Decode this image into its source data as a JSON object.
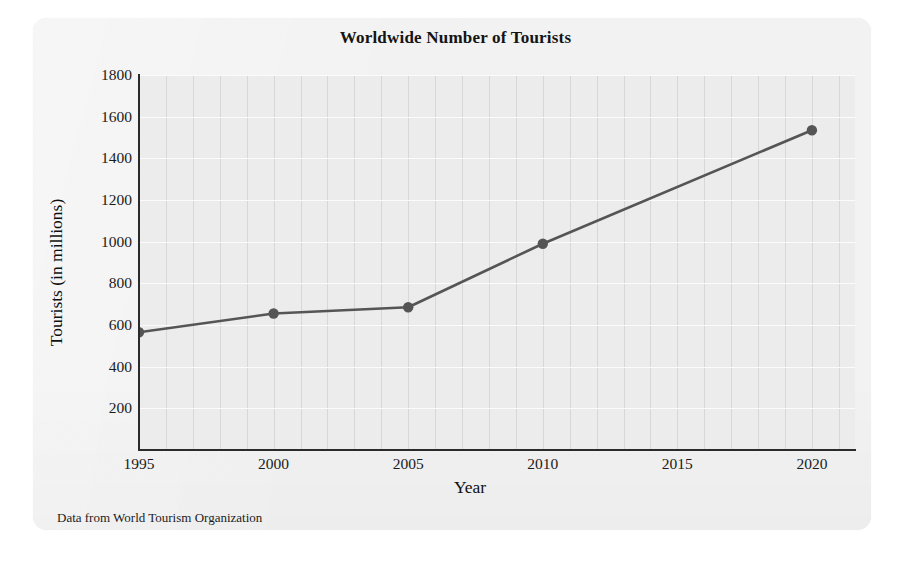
{
  "card": {
    "background_color": "#f2f2f2"
  },
  "chart_data": {
    "type": "line",
    "title": "Worldwide Number of Tourists",
    "xlabel": "Year",
    "ylabel": "Tourists (in millions)",
    "source_note": "Data from World Tourism Organization",
    "x": [
      1995,
      2000,
      2005,
      2010,
      2020
    ],
    "values": [
      565,
      655,
      685,
      990,
      1535
    ],
    "series": [
      {
        "name": "Worldwide tourists",
        "x": [
          1995,
          2000,
          2005,
          2010,
          2020
        ],
        "values": [
          565,
          655,
          685,
          990,
          1535
        ]
      }
    ],
    "xlim": [
      1995,
      2021.6
    ],
    "ylim": [
      0,
      1800
    ],
    "xticks": [
      1995,
      2000,
      2005,
      2010,
      2015,
      2020
    ],
    "xtick_labels": [
      "1995",
      "2000",
      "2005",
      "2010",
      "2015",
      "2020"
    ],
    "yticks": [
      200,
      400,
      600,
      800,
      1000,
      1200,
      1400,
      1600,
      1800
    ],
    "ytick_labels": [
      "200",
      "400",
      "600",
      "800",
      "1000",
      "1200",
      "1400",
      "1600",
      "1800"
    ],
    "grid": {
      "vertical": true,
      "vertical_step_years": 1,
      "vertical_color": "#d7d7d7",
      "horizontal": true,
      "horizontal_step": 200,
      "horizontal_color": "#fbfbfb"
    },
    "legend": null,
    "line_color": "#555555",
    "marker_color": "#555555",
    "marker_shape": "circle",
    "plot_background_color": "#ececec",
    "axis_color": "#2b2b2b"
  }
}
